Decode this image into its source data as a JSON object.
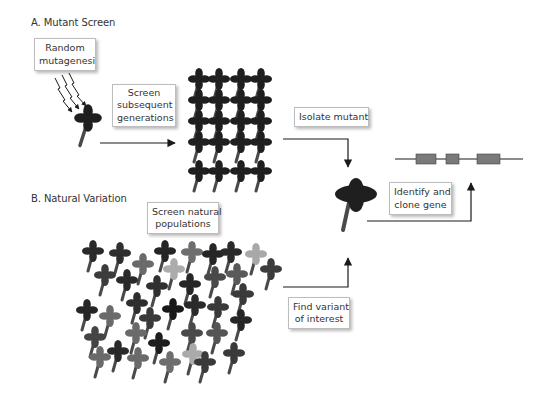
{
  "sections": {
    "a": {
      "label": "A. Mutant Screen"
    },
    "b": {
      "label": "B. Natural Variation"
    }
  },
  "boxes": {
    "random_mutagenesis": {
      "line1": "Random",
      "line2": "mutagenesi"
    },
    "screen_subsequent": {
      "line1": "Screen",
      "line2": "subsequent",
      "line3": "generations"
    },
    "isolate_mutant": {
      "line1": "Isolate mutant"
    },
    "identify_clone": {
      "line1": "Identify and",
      "line2": "clone gene"
    },
    "screen_natural": {
      "line1": "Screen natural",
      "line2": "populations"
    },
    "find_variant": {
      "line1": "Find variant",
      "line2": "of interest"
    }
  },
  "colors": {
    "dark": "#1f1f1f",
    "medium_dark": "#3a3a3a",
    "medium": "#5a5a5a",
    "medium_light": "#7a7a7a",
    "light": "#b4b4b4",
    "stem": "#4a4a4a",
    "arrow": "#1a1a1a",
    "exon": "#7a7a7a"
  },
  "mutant_grid": {
    "columns": 4,
    "rows": 5
  },
  "gene": {
    "exons": 3
  }
}
